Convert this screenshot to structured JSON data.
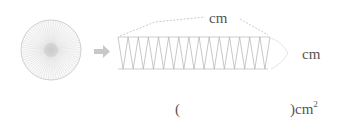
{
  "diagram": {
    "circle": {
      "icon": "sector-divided-circle",
      "color": "#b5b5b5"
    },
    "arrow": {
      "icon": "right-arrow",
      "color": "#c8c8c8"
    },
    "rectangle": {
      "icon": "zigzag-rectangle",
      "color": "#b5b5b5",
      "zigzag_count": 30
    },
    "top_label": {
      "unit": "cm"
    },
    "side_label": {
      "unit": "cm"
    },
    "answer": {
      "open_paren": "(",
      "close_paren": ")",
      "unit": "cm",
      "exponent": "2"
    }
  }
}
